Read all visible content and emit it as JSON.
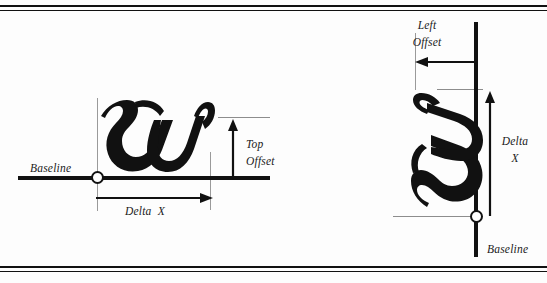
{
  "figure": {
    "background_color": "#fdfdfd",
    "ink_color": "#111111",
    "guide_color": "#9a9a9a"
  },
  "panels": [
    {
      "id": "horizontal-layout",
      "description": "Horizontal writing mode glyph metrics",
      "glyph": "w",
      "labels": {
        "baseline": "Baseline",
        "delta_x": "Delta  X",
        "top_offset_line1": "Top",
        "top_offset_line2": "Offset"
      }
    },
    {
      "id": "vertical-layout",
      "description": "Vertical writing mode glyph metrics",
      "glyph": "w",
      "labels": {
        "baseline": "Baseline",
        "delta_x_line1": "Delta",
        "delta_x_line2": "X",
        "left_offset_line1": "Left",
        "left_offset_line2": "Offset"
      }
    }
  ]
}
